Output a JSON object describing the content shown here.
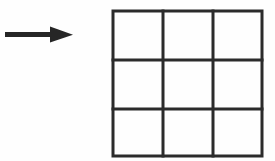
{
  "figure": {
    "title": "Arrow pointing to empty 3x3 grid",
    "background_color": "#fefefe",
    "stroke_color": "#2b2b2b",
    "width": 275,
    "height": 161,
    "arrow": {
      "label": "right-arrow",
      "direction": "right",
      "color": "#262626",
      "shaft": {
        "x_start": 5,
        "x_end": 55,
        "y_center": 34.5,
        "thickness": 5
      },
      "head": {
        "tip_x": 73,
        "base_x": 50,
        "half_height": 8
      }
    },
    "grid": {
      "label": "3x3-grid",
      "rows": 3,
      "columns": 3,
      "cell_count": 9,
      "color": "#2b2b2b",
      "line_width": 3,
      "bounds": {
        "left": 113,
        "top": 11,
        "right": 262,
        "bottom": 156
      },
      "vertical_lines_x": [
        113,
        163,
        213,
        262
      ],
      "horizontal_lines_y": [
        11,
        60,
        109,
        156
      ],
      "cells": [
        {
          "row": 1,
          "col": 1,
          "content": ""
        },
        {
          "row": 1,
          "col": 2,
          "content": ""
        },
        {
          "row": 1,
          "col": 3,
          "content": ""
        },
        {
          "row": 2,
          "col": 1,
          "content": ""
        },
        {
          "row": 2,
          "col": 2,
          "content": ""
        },
        {
          "row": 2,
          "col": 3,
          "content": ""
        },
        {
          "row": 3,
          "col": 1,
          "content": ""
        },
        {
          "row": 3,
          "col": 2,
          "content": ""
        },
        {
          "row": 3,
          "col": 3,
          "content": ""
        }
      ]
    }
  }
}
